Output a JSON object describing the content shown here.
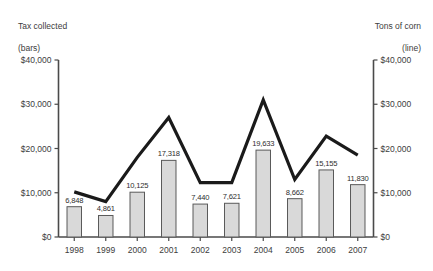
{
  "chart_data": {
    "type": "bar",
    "title": "",
    "subtitle": "",
    "xlabel": "",
    "ylabel": "Tax collected (bars)",
    "y2label": "Tons of corn (line)",
    "categories": [
      "1998",
      "1999",
      "2000",
      "2001",
      "2002",
      "2003",
      "2004",
      "2005",
      "2006",
      "2007"
    ],
    "ylim": [
      0,
      40000
    ],
    "y2lim": [
      0,
      40000
    ],
    "ytick_labels": [
      "$0",
      "$10,000",
      "$20,000",
      "$30,000",
      "$40,000"
    ],
    "ytick_values": [
      0,
      10000,
      20000,
      30000,
      40000
    ],
    "y2tick_labels": [
      "$0",
      "$10,000",
      "$20,000",
      "$30,000",
      "$40,000"
    ],
    "grid": false,
    "legend_position": "none",
    "series": [
      {
        "name": "Tax collected (bars)",
        "type": "bar",
        "values": [
          6848,
          4861,
          10125,
          17318,
          7440,
          7621,
          19633,
          8662,
          15155,
          11830
        ],
        "data_labels": [
          "6,848",
          "4,861",
          "10,125",
          "17,318",
          "7,440",
          "7,621",
          "19,633",
          "8,662",
          "15,155",
          "11,830"
        ],
        "fill_color": "#d9d9d9",
        "border_color": "#5a5a5a"
      },
      {
        "name": "Tons of corn (line)",
        "type": "line",
        "values": [
          10200,
          8000,
          18000,
          27000,
          12300,
          12300,
          31000,
          13000,
          22800,
          18500
        ],
        "line_color": "#1a1a1a"
      }
    ]
  },
  "captions": {
    "left_line1": "Tax collected",
    "left_line2": "(bars)",
    "right_line1": "Tons of corn",
    "right_line2": "(line)"
  },
  "axis_color": "#4a4a4a"
}
